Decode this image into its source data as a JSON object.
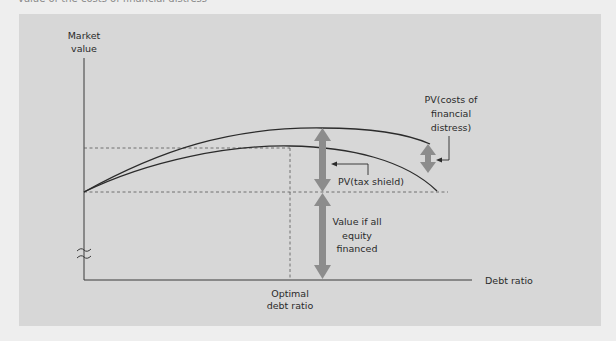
{
  "page": {
    "caption_bleed": "value of the costs of financial distress"
  },
  "diagram": {
    "y_axis_label": [
      "Market",
      "value"
    ],
    "x_axis_label": "Debt ratio",
    "optimal_label": [
      "Optimal",
      "debt ratio"
    ],
    "tax_shield_label": "PV(tax shield)",
    "distress_label": [
      "PV(costs of",
      "financial",
      "distress)"
    ],
    "equity_label": [
      "Value if all",
      "equity",
      "financed"
    ],
    "axis_break_symbol": "axis-break",
    "colors": {
      "panel": "#d7d7d7",
      "curve": "#2b2b2b",
      "arrow": "#8c8c8c",
      "dashed": "#555555",
      "text": "#2a2a2a"
    }
  }
}
